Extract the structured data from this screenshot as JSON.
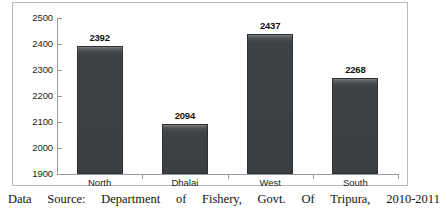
{
  "chart_data": {
    "type": "bar",
    "title": "",
    "subtitle": "",
    "xlabel": "",
    "ylabel": "",
    "categories": [
      "North",
      "Dhalai",
      "West",
      "South"
    ],
    "values": [
      2392,
      2094,
      2437,
      2268
    ],
    "series": [
      {
        "name": "Fish production",
        "values": [
          2392,
          2094,
          2437,
          2268
        ]
      }
    ],
    "data_labels": [
      "2392",
      "2094",
      "2437",
      "2268"
    ],
    "ylim": [
      1900,
      2500
    ],
    "ytick_labels": [
      "2500",
      "2400",
      "2300",
      "2200",
      "2100",
      "2000",
      "1900"
    ],
    "ytick_values": [
      2500,
      2400,
      2300,
      2200,
      2100,
      2000,
      1900
    ],
    "grid": false,
    "legend": false,
    "legend_position": "none",
    "bar_color": "#3f4245",
    "axis_color": "#9a9a9a",
    "frame_color": "#b9b9b9",
    "background": "#ffffff"
  },
  "caption": {
    "words": [
      "Data",
      "Source:",
      "Department",
      "of",
      "Fishery,",
      "Govt.",
      "Of",
      "Tripura,",
      "2010-2011"
    ],
    "full_text": "Data Source: Department of Fishery, Govt. Of Tripura, 2010-2011"
  }
}
